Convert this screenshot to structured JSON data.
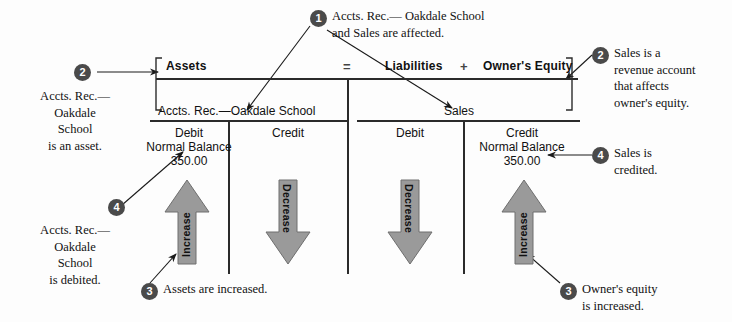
{
  "diagram": {
    "equation": {
      "assets_label": "Assets",
      "equals_sign": "=",
      "liabilities_label": "Liabilities",
      "plus_sign": "+",
      "owners_equity_label": "Owner's Equity"
    },
    "accounts": [
      {
        "name": "Accts. Rec.—Oakdale School",
        "debit": {
          "header": "Debit",
          "normal_balance_label": "Normal Balance",
          "amount": "350.00",
          "effect": "Increase",
          "direction": "up"
        },
        "credit": {
          "header": "Credit",
          "normal_balance_label": "",
          "amount": "",
          "effect": "Decrease",
          "direction": "down"
        }
      },
      {
        "name": "Sales",
        "debit": {
          "header": "Debit",
          "normal_balance_label": "",
          "amount": "",
          "effect": "Decrease",
          "direction": "down"
        },
        "credit": {
          "header": "Credit",
          "normal_balance_label": "Normal Balance",
          "amount": "350.00",
          "effect": "Increase",
          "direction": "up"
        }
      }
    ],
    "callouts": [
      {
        "number": "1",
        "text": "Accts. Rec.— Oakdale School\nand Sales are affected.",
        "position": "top-center"
      },
      {
        "number": "2",
        "text": "Accts. Rec.—\nOakdale\nSchool\nis an asset.",
        "position": "left-upper"
      },
      {
        "number": "2",
        "text": "Sales is a\nrevenue account\nthat affects\nowner's equity.",
        "position": "right-upper"
      },
      {
        "number": "4",
        "text": "Accts. Rec.—\nOakdale\nSchool\nis debited.",
        "position": "left-lower"
      },
      {
        "number": "4",
        "text": "Sales is\ncredited.",
        "position": "right-middle"
      },
      {
        "number": "3",
        "text": "Assets are increased.",
        "position": "bottom-left"
      },
      {
        "number": "3",
        "text": "Owner's equity\nis increased.",
        "position": "bottom-right"
      }
    ],
    "colors": {
      "arrow_fill": "#9a9a9a",
      "arrow_stroke": "#6e6e6e",
      "bullet_fill": "#4a4a4a",
      "rule": "#2b2b2b",
      "background": "#fdfdfd"
    }
  }
}
